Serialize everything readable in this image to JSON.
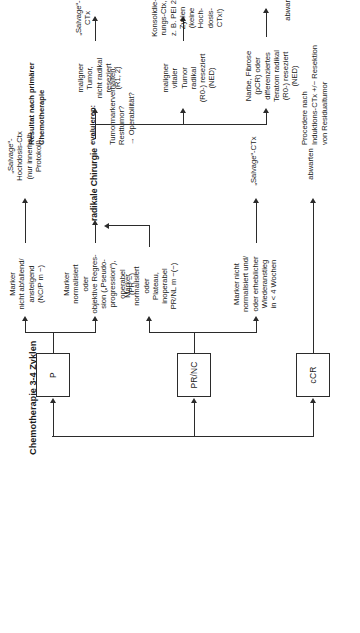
{
  "title": "Chemotherapie 3-4 Zyklen",
  "columns": {
    "result_header": "Resultat nach primärer\nChemotherapie",
    "evaluate_header": "evaluieren:",
    "evaluate_lines": "Tumormarkerverhalten;\nResttumor?\n→ Operabilität?",
    "procedure_header": "Procedere nach\nInduktions-CTx +/− Resektion\nvon Residualtumor"
  },
  "response_nodes": [
    {
      "id": "ccr",
      "label": "cCR"
    },
    {
      "id": "prnc",
      "label": "PR/NC"
    },
    {
      "id": "p",
      "label": "P"
    }
  ],
  "evaluation_nodes": [
    {
      "id": "eval-ccr",
      "label": ""
    },
    {
      "id": "eval-prnc-1",
      "label": "Marker nicht\nnormalisiert und/\noder erheblicher\nWiederanstieg\nin < 4 Wochen"
    },
    {
      "id": "eval-prnc-2",
      "label": "Marker\nnormalisiert\noder\nPlateau,\ninoperabel\nPR/NL m −(−)"
    },
    {
      "id": "eval-p-1",
      "label": "Marker\nnormalisiert\noder\nobjektive Regres-\nsion („Pseudo-\nprogression“),\noperabel\n(PR −)"
    },
    {
      "id": "eval-p-2",
      "label": "Marker\nnicht abfallend/\nansteigend\n(NC/P m −)"
    }
  ],
  "surgery_node": {
    "label": "radikale Chirurgie"
  },
  "histology_nodes": [
    {
      "id": "histo-1",
      "label": "Narbe, Fibrose\n(pCR) oder\ndifferenziertes\nTeratom radikal\n(R0-) reseziert\n(NED)"
    },
    {
      "id": "histo-2",
      "label": "maligner\nvitaler\nTumor\nradikal\n(R0-) reseziert\n(NED)"
    },
    {
      "id": "histo-3",
      "label": "maligner\nTumor,\nnicht radikal\nreseziert\n(R1, 2)"
    }
  ],
  "outcome_nodes": [
    {
      "id": "out-ccr",
      "label": "abwarten"
    },
    {
      "id": "out-prnc-wait",
      "label": "abwarten"
    },
    {
      "id": "out-prnc-salvage",
      "label": "„Salvage“-CTx"
    },
    {
      "id": "out-histo-1",
      "label": "abwarten"
    },
    {
      "id": "out-histo-2",
      "label": "Konsolidie-\nrungs-Ctx,\nz. B. PEI 2 Zyklen\n(keine Hoch-\ndosis-CTx!)"
    },
    {
      "id": "out-histo-3",
      "label": "„Salvage“-\nCTx"
    },
    {
      "id": "out-p",
      "label": "„Salvage“-\nHochdosis-Ctx\n(nur innerhalb\nProtokoll)"
    }
  ],
  "colors": {
    "line": "#2b2b2b",
    "text": "#1a1a1a",
    "background": "#ffffff"
  }
}
